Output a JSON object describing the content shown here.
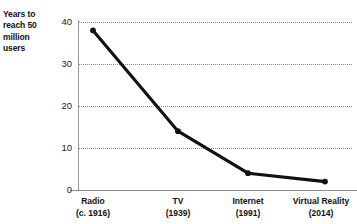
{
  "chart_data": {
    "type": "line",
    "title": "",
    "xlabel": "",
    "ylabel": "Years to reach 50 million users",
    "ylim": [
      0,
      42
    ],
    "yticks": [
      0,
      10,
      20,
      30,
      40
    ],
    "ytick_labels": [
      "0",
      "10",
      "20",
      "30",
      "40"
    ],
    "grid": true,
    "grid_axis": "y",
    "legend": false,
    "categories": [
      "Radio",
      "TV",
      "Internet",
      "Virtual Reality"
    ],
    "category_years": [
      "(c. 1916)",
      "(1939)",
      "(1991)",
      "(2014)"
    ],
    "values": [
      38,
      14,
      4,
      2
    ],
    "series": [
      {
        "name": "Years to reach 50 million users",
        "values": [
          38,
          14,
          4,
          2
        ],
        "color": "#111111",
        "marker": "circle"
      }
    ]
  },
  "axis": {
    "y_title_lines": [
      "Years to",
      "reach 50",
      "million",
      "users"
    ],
    "y_tick_labels": [
      "40",
      "30",
      "20",
      "10",
      "0"
    ],
    "x_tick_labels": [
      {
        "name": "Radio",
        "year": "(c. 1916)"
      },
      {
        "name": "TV",
        "year": "(1939)"
      },
      {
        "name": "Internet",
        "year": "(1991)"
      },
      {
        "name": "Virtual Reality",
        "year": "(2014)"
      }
    ]
  },
  "colors": {
    "line": "#111111",
    "marker": "#111111",
    "gridline": "#8d8d8d",
    "axis": "#8e8e8e",
    "text": "#111111",
    "background": "#ffffff"
  }
}
